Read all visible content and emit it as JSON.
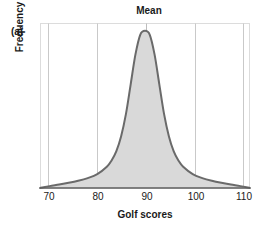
{
  "figure": {
    "panel_label": "(a)",
    "annotation_top": "Mean"
  },
  "chart_data": {
    "type": "area",
    "title": "Mean",
    "xlabel": "Golf scores",
    "ylabel": "Frequency",
    "xlim": [
      68,
      112
    ],
    "ylim": [
      0,
      1.05
    ],
    "xticks": [
      70,
      80,
      90,
      100,
      110
    ],
    "xticklabels": [
      "70",
      "80",
      "90",
      "100",
      "110"
    ],
    "yticks": [],
    "yticklabels": [],
    "grid": "vertical-only",
    "legend": "none",
    "annotations": [
      {
        "text": "Mean",
        "x": 90,
        "position": "above-axis-top",
        "pointer": "vertical-line-at-x-90"
      }
    ],
    "distribution": {
      "shape": "leptokurtic",
      "description": "symmetric peaked bell with heavy flat tails",
      "mean": 90,
      "mode": 90,
      "median": 90,
      "peak_value": 1.0
    },
    "x": [
      68,
      70,
      72,
      74,
      76,
      78,
      80,
      82,
      83,
      84,
      85,
      86,
      87,
      88,
      89,
      90,
      91,
      92,
      93,
      94,
      95,
      96,
      97,
      98,
      100,
      102,
      104,
      106,
      108,
      110,
      112
    ],
    "values": [
      0.0,
      0.012,
      0.022,
      0.033,
      0.046,
      0.063,
      0.088,
      0.135,
      0.175,
      0.235,
      0.33,
      0.47,
      0.66,
      0.85,
      0.975,
      1.0,
      0.975,
      0.85,
      0.66,
      0.47,
      0.33,
      0.235,
      0.175,
      0.135,
      0.088,
      0.063,
      0.046,
      0.033,
      0.022,
      0.012,
      0.0
    ],
    "style": {
      "fill_color": "#d9d9d9",
      "line_color": "#6a6a6a",
      "gridline_color": "#c9c9c9",
      "frame_color": "#d0d0d0",
      "axis_color": "#5a5a5a",
      "text_color": "#1a1a1a",
      "background": "#ffffff"
    }
  }
}
